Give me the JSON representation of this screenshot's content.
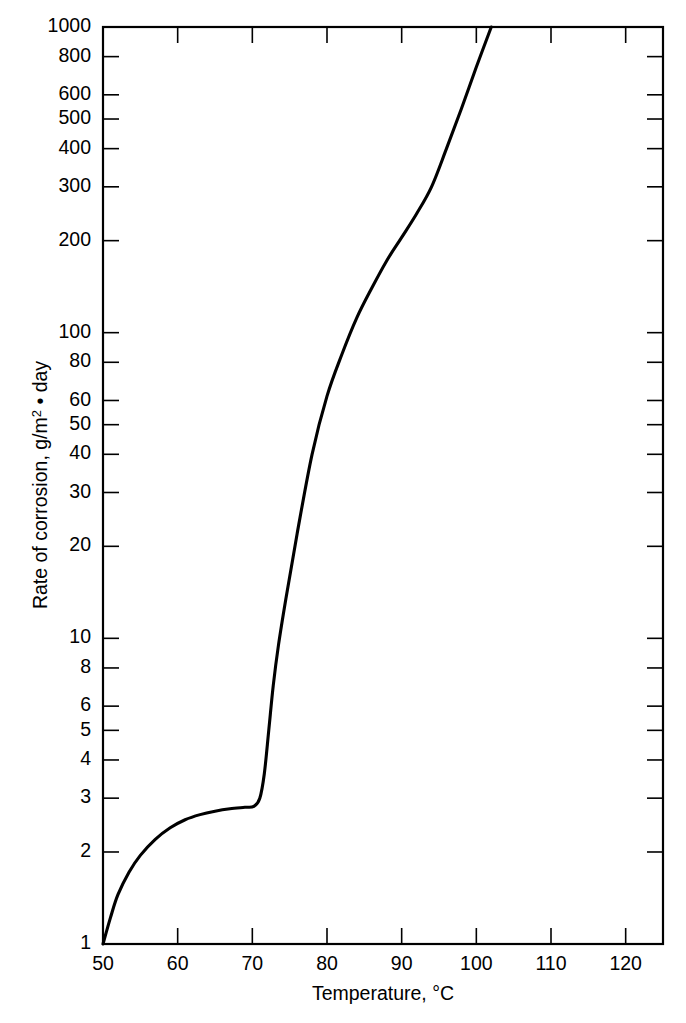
{
  "figure": {
    "background": "#ffffff",
    "ink_color": "#000000"
  },
  "axes": {
    "x_title": "Temperature, °C",
    "y_title_part1": "Rate of corrosion, g/m",
    "y_title_sup": "2",
    "y_title_part2": " • day",
    "y_title_full": "Rate of corrosion, g/m2 • day"
  },
  "chart_data": {
    "type": "line",
    "title": "",
    "xlabel": "Temperature, °C",
    "ylabel": "Rate of corrosion, g/m2 • day",
    "xscale": "linear",
    "yscale": "log",
    "xlim": [
      50,
      125
    ],
    "ylim": [
      1,
      1000
    ],
    "grid": false,
    "legend": null,
    "xticks": [
      50,
      60,
      70,
      80,
      90,
      100,
      110,
      120
    ],
    "xticklabels": [
      "50",
      "60",
      "70",
      "80",
      "90",
      "100",
      "110",
      "120"
    ],
    "yticks": [
      1,
      2,
      3,
      4,
      5,
      6,
      8,
      10,
      20,
      30,
      40,
      50,
      60,
      80,
      100,
      200,
      300,
      400,
      500,
      600,
      800,
      1000
    ],
    "yticklabels": [
      "1",
      "2",
      "3",
      "4",
      "5",
      "6",
      "8",
      "10",
      "20",
      "30",
      "40",
      "50",
      "60",
      "80",
      "100",
      "200",
      "300",
      "400",
      "500",
      "600",
      "800",
      "1000"
    ],
    "series": [
      {
        "name": "Rate of corrosion",
        "x": [
          50,
          51,
          52,
          53.5,
          55,
          57,
          59,
          61,
          63,
          65,
          67,
          69,
          70.2,
          71,
          71.6,
          72.2,
          72.8,
          73.5,
          74.5,
          76,
          78,
          80,
          82,
          84,
          86,
          88,
          90,
          92,
          94,
          96,
          98,
          100,
          102
        ],
        "y": [
          1.0,
          1.22,
          1.45,
          1.72,
          1.95,
          2.2,
          2.4,
          2.55,
          2.65,
          2.72,
          2.77,
          2.8,
          2.82,
          3.0,
          3.6,
          5.0,
          7.0,
          9.5,
          13.5,
          22,
          40,
          62,
          85,
          112,
          140,
          172,
          205,
          245,
          300,
          400,
          540,
          740,
          1000
        ]
      }
    ],
    "annotations": []
  }
}
